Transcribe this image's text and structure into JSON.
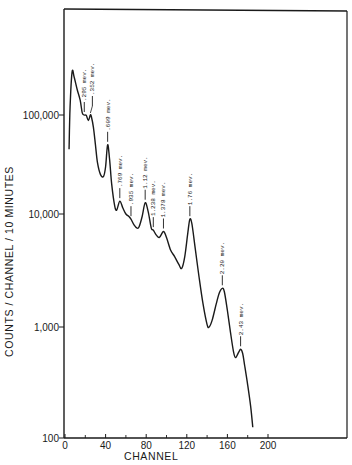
{
  "chart_data": {
    "type": "line",
    "title": "",
    "xlabel": "CHANNEL",
    "ylabel": "COUNTS / CHANNEL / 10 MINUTES",
    "xscale": "linear",
    "yscale": "log",
    "xlim": [
      0,
      280
    ],
    "ylim": [
      100,
      500000
    ],
    "grid": false,
    "legend": "none",
    "x_ticks": [
      0,
      40,
      80,
      120,
      160,
      200
    ],
    "x_tick_labels": [
      "0",
      "40",
      "80",
      "120",
      "160",
      "200"
    ],
    "x_minor_ticks": [
      20,
      60,
      100,
      140,
      180
    ],
    "y_ticks": [
      100,
      1000,
      10000,
      100000
    ],
    "y_tick_labels": [
      "100",
      "1,000",
      "10,000",
      "100,000"
    ],
    "series": [
      {
        "name": "spectrum",
        "points": [
          [
            4,
            45000
          ],
          [
            5,
            120000
          ],
          [
            7,
            270000
          ],
          [
            9,
            240000
          ],
          [
            12,
            180000
          ],
          [
            15,
            140000
          ],
          [
            17,
            105000
          ],
          [
            19,
            100000
          ],
          [
            21,
            99000
          ],
          [
            23,
            88000
          ],
          [
            25,
            100000
          ],
          [
            26,
            96000
          ],
          [
            28,
            75000
          ],
          [
            30,
            50000
          ],
          [
            32,
            33000
          ],
          [
            35,
            25000
          ],
          [
            38,
            24000
          ],
          [
            40,
            30000
          ],
          [
            42,
            50000
          ],
          [
            44,
            35000
          ],
          [
            46,
            20000
          ],
          [
            49,
            12000
          ],
          [
            51,
            11000
          ],
          [
            54,
            13500
          ],
          [
            57,
            11500
          ],
          [
            60,
            10000
          ],
          [
            63,
            9500
          ],
          [
            65,
            9000
          ],
          [
            68,
            8000
          ],
          [
            71,
            7500
          ],
          [
            73,
            7700
          ],
          [
            76,
            9500
          ],
          [
            79,
            13000
          ],
          [
            82,
            10500
          ],
          [
            85,
            7500
          ],
          [
            87,
            7200
          ],
          [
            90,
            6500
          ],
          [
            93,
            6200
          ],
          [
            97,
            7000
          ],
          [
            100,
            6200
          ],
          [
            104,
            4800
          ],
          [
            108,
            4200
          ],
          [
            112,
            3600
          ],
          [
            115,
            3300
          ],
          [
            118,
            4200
          ],
          [
            121,
            6800
          ],
          [
            123,
            9000
          ],
          [
            125,
            8200
          ],
          [
            128,
            5200
          ],
          [
            132,
            2800
          ],
          [
            136,
            1600
          ],
          [
            140,
            1050
          ],
          [
            142,
            1000
          ],
          [
            145,
            1150
          ],
          [
            149,
            1600
          ],
          [
            152,
            2000
          ],
          [
            155,
            2200
          ],
          [
            157,
            2050
          ],
          [
            160,
            1400
          ],
          [
            163,
            900
          ],
          [
            166,
            600
          ],
          [
            168,
            530
          ],
          [
            171,
            590
          ],
          [
            173,
            630
          ],
          [
            175,
            580
          ],
          [
            177,
            450
          ],
          [
            180,
            300
          ],
          [
            183,
            190
          ],
          [
            185,
            125
          ]
        ]
      }
    ],
    "annotations": [
      {
        "text": ".295 mev.",
        "x": 19,
        "y": 100000
      },
      {
        "text": ".352 mev.",
        "x": 25,
        "y": 100000
      },
      {
        "text": ".609 mev.",
        "x": 42,
        "y": 50000
      },
      {
        "text": ".769 mev.",
        "x": 54,
        "y": 13500
      },
      {
        "text": ".935 mev.",
        "x": 65,
        "y": 9000
      },
      {
        "text": "1.12 mev.",
        "x": 79,
        "y": 13000
      },
      {
        "text": "1.238 mev.",
        "x": 87,
        "y": 7200
      },
      {
        "text": "1.378 mev.",
        "x": 97,
        "y": 7000
      },
      {
        "text": "1.76 mev.",
        "x": 123,
        "y": 9000
      },
      {
        "text": "2.20 mev.",
        "x": 155,
        "y": 2200
      },
      {
        "text": "2.43 mev.",
        "x": 173,
        "y": 630
      }
    ]
  }
}
